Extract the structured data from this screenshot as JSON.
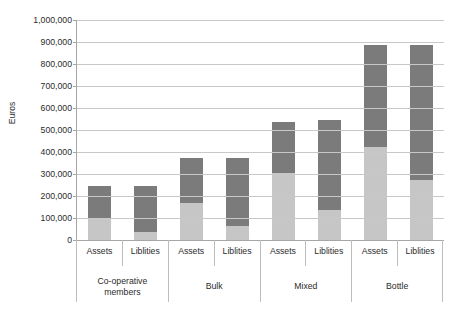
{
  "chart_data": {
    "type": "bar",
    "subtype": "stacked-column",
    "title": "",
    "xlabel": "",
    "ylabel": "Euros",
    "ylim": [
      0,
      1000000
    ],
    "ytick_values": [
      0,
      100000,
      200000,
      300000,
      400000,
      500000,
      600000,
      700000,
      800000,
      900000,
      1000000
    ],
    "ytick_labels": [
      "0",
      "100,000",
      "200,000",
      "300,000",
      "400,000",
      "500,000",
      "600,000",
      "700,000",
      "800,000",
      "900,000",
      "1,000,000"
    ],
    "grid": true,
    "legend": "none",
    "groups": [
      "Co-operative members",
      "Bulk",
      "Mixed",
      "Bottle"
    ],
    "categories": [
      "Assets",
      "Liblities",
      "Assets",
      "Liblities",
      "Assets",
      "Liblities",
      "Assets",
      "Liblities"
    ],
    "series": [
      {
        "name": "lower-segment",
        "color": "#c6c6c6",
        "values": [
          100000,
          36000,
          168000,
          64000,
          304000,
          136000,
          423000,
          273000
        ]
      },
      {
        "name": "upper-segment",
        "color": "#7b7b7b",
        "values": [
          145000,
          209000,
          205000,
          309000,
          232000,
          409000,
          462000,
          612000
        ]
      }
    ],
    "totals": [
      245000,
      245000,
      373000,
      373000,
      536000,
      545000,
      885000,
      885000
    ],
    "bars": [
      {
        "group": "Co-operative members",
        "category": "Assets",
        "lower": 100000,
        "upper": 145000,
        "total": 245000
      },
      {
        "group": "Co-operative members",
        "category": "Liblities",
        "lower": 36000,
        "upper": 209000,
        "total": 245000
      },
      {
        "group": "Bulk",
        "category": "Assets",
        "lower": 168000,
        "upper": 205000,
        "total": 373000
      },
      {
        "group": "Bulk",
        "category": "Liblities",
        "lower": 64000,
        "upper": 309000,
        "total": 373000
      },
      {
        "group": "Mixed",
        "category": "Assets",
        "lower": 304000,
        "upper": 232000,
        "total": 536000
      },
      {
        "group": "Mixed",
        "category": "Liblities",
        "lower": 136000,
        "upper": 409000,
        "total": 545000
      },
      {
        "group": "Bottle",
        "category": "Assets",
        "lower": 423000,
        "upper": 462000,
        "total": 885000
      },
      {
        "group": "Bottle",
        "category": "Liblities",
        "lower": 273000,
        "upper": 612000,
        "total": 885000
      }
    ]
  },
  "axis": {
    "y_title": "Euros",
    "ticks": [
      "1,000,000",
      "900,000",
      "800,000",
      "700,000",
      "600,000",
      "500,000",
      "400,000",
      "300,000",
      "200,000",
      "100,000",
      "0"
    ]
  },
  "category_axis": {
    "level1": [
      {
        "label": "Assets"
      },
      {
        "label": "Liblities"
      },
      {
        "label": "Assets"
      },
      {
        "label": "Liblities"
      },
      {
        "label": "Assets"
      },
      {
        "label": "Liblities"
      },
      {
        "label": "Assets"
      },
      {
        "label": "Liblities"
      }
    ],
    "level2": [
      {
        "label": "Co-operative members",
        "line1": "Co-operative",
        "line2": "members"
      },
      {
        "label": "Bulk",
        "line1": "Bulk",
        "line2": ""
      },
      {
        "label": "Mixed",
        "line1": "Mixed",
        "line2": ""
      },
      {
        "label": "Bottle",
        "line1": "Bottle",
        "line2": ""
      }
    ]
  },
  "colors": {
    "segment_lower": "#c6c6c6",
    "segment_upper": "#7b7b7b",
    "gridline": "#c8c8c8",
    "axis_line": "#a6a6a6",
    "text": "#2b2b2b",
    "background": "#ffffff"
  }
}
